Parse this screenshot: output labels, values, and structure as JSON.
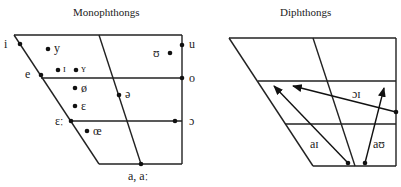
{
  "monophthongs": {
    "title": "Monophthongs",
    "vowels": {
      "i": "i",
      "y": "y",
      "e": "e",
      "I": "ɪ",
      "Y": "ʏ",
      "oe_slash": "ø",
      "epsilon": "ɛ",
      "epsilon_long": "ɛː",
      "oe": "œ",
      "schwa": "ə",
      "u": "u",
      "upsilon": "ʊ",
      "o": "o",
      "open_o": "ɔ",
      "a": "a, aː"
    }
  },
  "diphthongs": {
    "title": "Diphthongs",
    "labels": {
      "oi": "ɔɪ",
      "ai": "aɪ",
      "au": "aʊ"
    }
  },
  "colors": {
    "line": "#222222",
    "background": "#ffffff"
  }
}
